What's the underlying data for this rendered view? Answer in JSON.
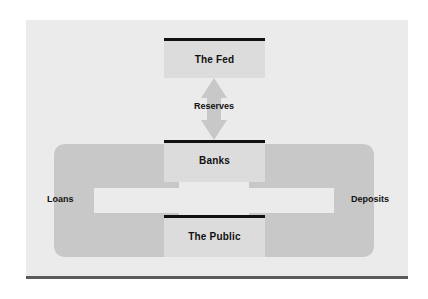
{
  "diagram": {
    "background_color": "#ebebeb",
    "frame_rule_color": "#5a5a5a",
    "box_fill_color": "#dcdcdc",
    "box_bar_color": "#111111",
    "arrow_fill_color": "#c8c8c8",
    "entities": [
      {
        "id": "fed",
        "label": "The Fed"
      },
      {
        "id": "banks",
        "label": "Banks"
      },
      {
        "id": "public",
        "label": "The Public"
      }
    ],
    "flows": [
      {
        "id": "reserves",
        "label": "Reserves",
        "shape": "double-headed-vertical-arrow",
        "from": "The Fed",
        "to": "Banks",
        "direction": "bidirectional"
      },
      {
        "id": "loans",
        "label": "Loans",
        "shape": "c-bracket-double-arrow",
        "side": "left",
        "from": "Banks",
        "to": "The Public",
        "direction": "bidirectional"
      },
      {
        "id": "deposits",
        "label": "Deposits",
        "shape": "c-bracket-double-arrow",
        "side": "right",
        "from": "The Public",
        "to": "Banks",
        "direction": "bidirectional"
      }
    ]
  }
}
